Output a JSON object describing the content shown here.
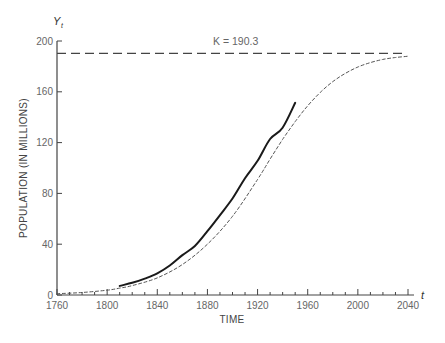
{
  "chart_data": {
    "type": "line",
    "title": "",
    "xlabel": "TIME",
    "ylabel": "POPULATION (IN MILLIONS)",
    "x_axis_variable": "t",
    "y_axis_variable": "Y",
    "y_axis_variable_subscript": "t",
    "xlim": [
      1760,
      2040
    ],
    "ylim": [
      0,
      200
    ],
    "x_ticks": [
      1760,
      1800,
      1840,
      1880,
      1920,
      1960,
      2000,
      2040
    ],
    "x_minor_tick_step": 10,
    "y_ticks": [
      0,
      40,
      80,
      120,
      160,
      200
    ],
    "grid": false,
    "legend": null,
    "annotations": [
      {
        "text": "K = 190.3",
        "type": "horizontal_asymptote",
        "y": 190.3,
        "style": "long-dash"
      }
    ],
    "series": [
      {
        "name": "Fitted logistic curve",
        "style": "short-dash",
        "x": [
          1760,
          1780,
          1800,
          1810,
          1820,
          1840,
          1860,
          1880,
          1900,
          1920,
          1930,
          1940,
          1950,
          1960,
          1970,
          1980,
          1990,
          2000,
          2010,
          2020,
          2030,
          2040
        ],
        "values": [
          1.0,
          2.0,
          3.8,
          5.4,
          7.4,
          13.5,
          24.0,
          40.0,
          62.0,
          91.0,
          107.0,
          122.5,
          136.5,
          149.0,
          159.5,
          168.0,
          174.5,
          179.5,
          183.0,
          185.5,
          187.0,
          188.0
        ]
      },
      {
        "name": "Observed population",
        "style": "solid",
        "x": [
          1810,
          1820,
          1830,
          1840,
          1850,
          1860,
          1870,
          1880,
          1890,
          1900,
          1910,
          1920,
          1930,
          1940,
          1950
        ],
        "values": [
          7.2,
          9.6,
          12.9,
          17.1,
          23.2,
          31.4,
          38.6,
          50.2,
          62.9,
          76.0,
          92.0,
          105.7,
          122.8,
          131.7,
          151.3
        ]
      }
    ]
  },
  "labels": {
    "k_annotation": "K = 190.3",
    "x_axis_title": "TIME",
    "y_axis_title": "POPULATION (IN MILLIONS)",
    "x_var": "t",
    "y_var": "Y",
    "y_var_sub": "t"
  }
}
